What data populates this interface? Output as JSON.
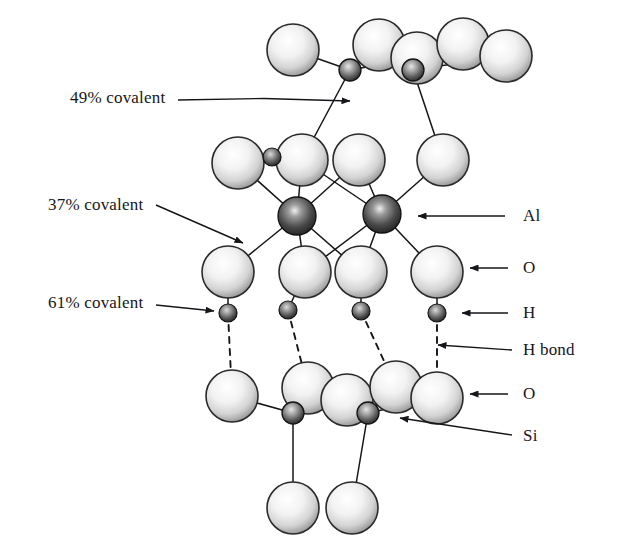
{
  "figure": {
    "type": "molecular-structure-diagram",
    "background_color": "#ffffff",
    "ink_color": "#16161a"
  },
  "labels": {
    "left": [
      {
        "id": "covalent-49",
        "text": "49% covalent",
        "x": 70,
        "y": 98,
        "anchor_x": 178,
        "anchor_y": 100,
        "tip_x": 350,
        "tip_y": 101
      },
      {
        "id": "covalent-37",
        "text": "37% covalent",
        "x": 48,
        "y": 205,
        "anchor_x": 156,
        "anchor_y": 205,
        "tip_x": 243,
        "tip_y": 243
      },
      {
        "id": "covalent-61",
        "text": "61% covalent",
        "x": 48,
        "y": 303,
        "anchor_x": 156,
        "anchor_y": 305,
        "tip_x": 214,
        "tip_y": 311
      }
    ],
    "right": [
      {
        "id": "atom-al",
        "text": "Al",
        "x": 523,
        "y": 216,
        "tip_x": 418,
        "tip_y": 216,
        "tail_x": 505,
        "tail_y": 216
      },
      {
        "id": "atom-o-upper",
        "text": "O",
        "x": 523,
        "y": 268,
        "tip_x": 470,
        "tip_y": 268,
        "tail_x": 508,
        "tail_y": 268
      },
      {
        "id": "atom-h",
        "text": "H",
        "x": 523,
        "y": 313,
        "tip_x": 462,
        "tip_y": 313,
        "tail_x": 508,
        "tail_y": 313
      },
      {
        "id": "h-bond",
        "text": "H bond",
        "x": 523,
        "y": 350,
        "tip_x": 438,
        "tip_y": 345,
        "tail_x": 512,
        "tail_y": 350
      },
      {
        "id": "atom-o-lower",
        "text": "O",
        "x": 523,
        "y": 394,
        "tip_x": 470,
        "tip_y": 394,
        "tail_x": 508,
        "tail_y": 394
      },
      {
        "id": "atom-si",
        "text": "Si",
        "x": 523,
        "y": 436,
        "tip_x": 400,
        "tip_y": 418,
        "tail_x": 512,
        "tail_y": 435
      }
    ]
  },
  "atom_styles": {
    "oxygen": {
      "name": "O",
      "radius": 26,
      "fill_center": "#ffffff",
      "fill_mid": "#e8e8e8",
      "fill_edge": "#8f8f8f",
      "stroke": "#2a2a2a"
    },
    "silicon": {
      "name": "Si",
      "radius": 11,
      "fill_center": "#d9d9d9",
      "fill_mid": "#7a7a7a",
      "fill_edge": "#2b2b2b",
      "stroke": "#141414"
    },
    "aluminium": {
      "name": "Al",
      "radius": 19,
      "fill_center": "#e0e0e0",
      "fill_mid": "#6e6e6e",
      "fill_edge": "#242424",
      "stroke": "#101010"
    },
    "hydrogen": {
      "name": "H",
      "radius": 9,
      "fill_center": "#cfcfcf",
      "fill_mid": "#6f6f6f",
      "fill_edge": "#252525",
      "stroke": "#121212"
    }
  },
  "atoms": [
    {
      "id": "o-top-1",
      "element": "O",
      "x": 293,
      "y": 50
    },
    {
      "id": "o-top-2",
      "element": "O",
      "x": 379,
      "y": 45
    },
    {
      "id": "o-top-3",
      "element": "O",
      "x": 417,
      "y": 58
    },
    {
      "id": "o-top-4",
      "element": "O",
      "x": 463,
      "y": 44
    },
    {
      "id": "o-top-5",
      "element": "O",
      "x": 506,
      "y": 56
    },
    {
      "id": "si-top-1",
      "element": "Si",
      "x": 350,
      "y": 70
    },
    {
      "id": "si-top-2",
      "element": "Si",
      "x": 413,
      "y": 70
    },
    {
      "id": "o-mid-up-1",
      "element": "O",
      "x": 238,
      "y": 163
    },
    {
      "id": "o-mid-up-2",
      "element": "O",
      "x": 302,
      "y": 160
    },
    {
      "id": "o-mid-up-3",
      "element": "O",
      "x": 359,
      "y": 160
    },
    {
      "id": "o-mid-up-4",
      "element": "O",
      "x": 443,
      "y": 160
    },
    {
      "id": "h-mid-up",
      "element": "H",
      "x": 272,
      "y": 157
    },
    {
      "id": "al-left",
      "element": "Al",
      "x": 297,
      "y": 216
    },
    {
      "id": "al-right",
      "element": "Al",
      "x": 382,
      "y": 214
    },
    {
      "id": "o-mid-dn-1",
      "element": "O",
      "x": 228,
      "y": 272
    },
    {
      "id": "o-mid-dn-2",
      "element": "O",
      "x": 305,
      "y": 272
    },
    {
      "id": "o-mid-dn-3",
      "element": "O",
      "x": 361,
      "y": 272
    },
    {
      "id": "o-mid-dn-4",
      "element": "O",
      "x": 437,
      "y": 272
    },
    {
      "id": "h-1",
      "element": "H",
      "x": 228,
      "y": 313
    },
    {
      "id": "h-2",
      "element": "H",
      "x": 288,
      "y": 310
    },
    {
      "id": "h-3",
      "element": "H",
      "x": 361,
      "y": 311
    },
    {
      "id": "h-4",
      "element": "H",
      "x": 437,
      "y": 313
    },
    {
      "id": "o-bot-1",
      "element": "O",
      "x": 232,
      "y": 396
    },
    {
      "id": "o-bot-2",
      "element": "O",
      "x": 308,
      "y": 388
    },
    {
      "id": "o-bot-3",
      "element": "O",
      "x": 347,
      "y": 400
    },
    {
      "id": "o-bot-4",
      "element": "O",
      "x": 396,
      "y": 387
    },
    {
      "id": "o-bot-5",
      "element": "O",
      "x": 437,
      "y": 398
    },
    {
      "id": "si-bot-1",
      "element": "Si",
      "x": 293,
      "y": 413
    },
    {
      "id": "si-bot-2",
      "element": "Si",
      "x": 368,
      "y": 413
    },
    {
      "id": "o-base-1",
      "element": "O",
      "x": 293,
      "y": 508
    },
    {
      "id": "o-base-2",
      "element": "O",
      "x": 352,
      "y": 508
    }
  ],
  "bonds": [
    {
      "from": "o-top-1",
      "to": "si-top-1",
      "style": "solid"
    },
    {
      "from": "si-top-1",
      "to": "o-top-2",
      "style": "solid"
    },
    {
      "from": "si-top-1",
      "to": "o-top-3",
      "style": "solid"
    },
    {
      "from": "si-top-2",
      "to": "o-top-3",
      "style": "solid"
    },
    {
      "from": "si-top-2",
      "to": "o-top-4",
      "style": "solid"
    },
    {
      "from": "si-top-2",
      "to": "o-top-5",
      "style": "solid"
    },
    {
      "from": "si-top-1",
      "to": "o-mid-up-2",
      "style": "solid"
    },
    {
      "from": "si-top-2",
      "to": "o-mid-up-4",
      "style": "solid"
    },
    {
      "from": "h-mid-up",
      "to": "o-mid-up-2",
      "style": "solid"
    },
    {
      "from": "o-mid-up-1",
      "to": "al-left",
      "style": "solid"
    },
    {
      "from": "o-mid-up-2",
      "to": "al-left",
      "style": "solid"
    },
    {
      "from": "o-mid-up-3",
      "to": "al-left",
      "style": "solid"
    },
    {
      "from": "o-mid-up-2",
      "to": "al-right",
      "style": "solid"
    },
    {
      "from": "o-mid-up-3",
      "to": "al-right",
      "style": "solid"
    },
    {
      "from": "o-mid-up-4",
      "to": "al-right",
      "style": "solid"
    },
    {
      "from": "al-left",
      "to": "o-mid-dn-1",
      "style": "solid"
    },
    {
      "from": "al-left",
      "to": "o-mid-dn-2",
      "style": "solid"
    },
    {
      "from": "al-left",
      "to": "o-mid-dn-3",
      "style": "solid"
    },
    {
      "from": "al-right",
      "to": "o-mid-dn-2",
      "style": "solid"
    },
    {
      "from": "al-right",
      "to": "o-mid-dn-3",
      "style": "solid"
    },
    {
      "from": "al-right",
      "to": "o-mid-dn-4",
      "style": "solid"
    },
    {
      "from": "o-mid-dn-1",
      "to": "h-1",
      "style": "solid"
    },
    {
      "from": "o-mid-dn-2",
      "to": "h-2",
      "style": "solid"
    },
    {
      "from": "o-mid-dn-3",
      "to": "h-3",
      "style": "solid"
    },
    {
      "from": "o-mid-dn-4",
      "to": "h-4",
      "style": "solid"
    },
    {
      "from": "h-1",
      "to": "o-bot-1",
      "style": "dashed"
    },
    {
      "from": "h-2",
      "to": "o-bot-2",
      "style": "dashed"
    },
    {
      "from": "h-3",
      "to": "o-bot-4",
      "style": "dashed"
    },
    {
      "from": "h-4",
      "to": "o-bot-5",
      "style": "dashed"
    },
    {
      "from": "o-bot-1",
      "to": "si-bot-1",
      "style": "solid"
    },
    {
      "from": "si-bot-1",
      "to": "o-bot-2",
      "style": "solid"
    },
    {
      "from": "si-bot-1",
      "to": "o-bot-3",
      "style": "solid"
    },
    {
      "from": "si-bot-2",
      "to": "o-bot-3",
      "style": "solid"
    },
    {
      "from": "si-bot-2",
      "to": "o-bot-4",
      "style": "solid"
    },
    {
      "from": "si-bot-2",
      "to": "o-bot-5",
      "style": "solid"
    },
    {
      "from": "si-bot-1",
      "to": "o-base-1",
      "style": "solid"
    },
    {
      "from": "si-bot-2",
      "to": "o-base-2",
      "style": "solid"
    }
  ]
}
